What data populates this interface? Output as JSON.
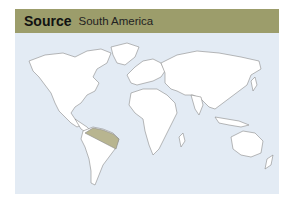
{
  "header": {
    "title": "Source",
    "subtitle": "South America"
  },
  "map": {
    "type": "world-outline",
    "highlighted_region": "Northern South America (Amazon basin)",
    "colors": {
      "header_bg": "#9c9d6b",
      "ocean": "#e3ebf4",
      "land": "#ffffff",
      "outline": "#8a8a8a",
      "highlight": "#b8b590"
    }
  }
}
